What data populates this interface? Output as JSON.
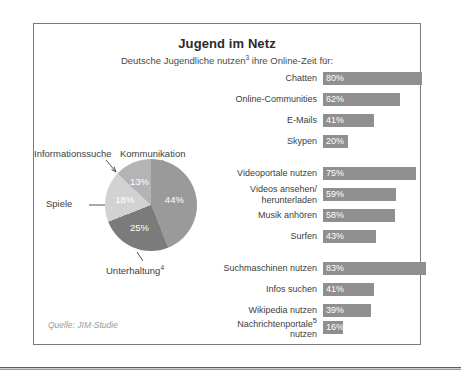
{
  "title": "Jugend im Netz",
  "subtitle_pre": "Deutsche Jugendliche nutzen",
  "subtitle_sup": "3",
  "subtitle_post": " ihre Online-Zeit für:",
  "source": "Quelle: JIM-Studie",
  "colors": {
    "bar": "#8f8f8f",
    "frame": "#7a7a7a",
    "pie_kommunikation": "#9a9a9a",
    "pie_unterhaltung": "#7b7b7b",
    "pie_spiele": "#d2d2d2",
    "pie_informationssuche": "#b4b4b4",
    "value_text": "#ffffff",
    "source_text": "#9a9a9a"
  },
  "chart_data": [
    {
      "type": "bar",
      "title": "Jugend im Netz",
      "subtitle": "Deutsche Jugendliche nutzen³ ihre Online-Zeit für:",
      "xlabel": "",
      "ylabel": "",
      "xlim": [
        0,
        100
      ],
      "unit": "%",
      "grid": false,
      "legend": "none",
      "orientation": "horizontal",
      "groups": [
        {
          "name": "Kommunikation",
          "categories": [
            "Chatten",
            "Online-Communities",
            "E-Mails",
            "Skypen"
          ],
          "values": [
            80,
            62,
            41,
            20
          ],
          "value_labels": [
            "80%",
            "62%",
            "41%",
            "20%"
          ]
        },
        {
          "name": "Unterhaltung",
          "categories": [
            "Videoportale nutzen",
            "Videos ansehen/\nherunterladen",
            "Musik anhören",
            "Surfen"
          ],
          "values": [
            75,
            59,
            58,
            43
          ],
          "value_labels": [
            "75%",
            "59%",
            "58%",
            "43%"
          ]
        },
        {
          "name": "Informationssuche",
          "categories": [
            "Suchmaschinen nutzen",
            "Infos suchen",
            "Wikipedia nutzen",
            "Nachrichtenportale⁵\nnutzen"
          ],
          "values": [
            83,
            41,
            39,
            16
          ],
          "value_labels": [
            "83%",
            "41%",
            "39%",
            "16%"
          ]
        }
      ]
    },
    {
      "type": "pie",
      "title": "",
      "legend": "callout-labels",
      "categories": [
        "Kommunikation",
        "Unterhaltung⁴",
        "Spiele",
        "Informationssuche"
      ],
      "values": [
        44,
        25,
        18,
        13
      ],
      "value_labels": [
        "44%",
        "25%",
        "18%",
        "13%"
      ],
      "colors": [
        "#9a9a9a",
        "#7b7b7b",
        "#d2d2d2",
        "#b4b4b4"
      ]
    }
  ],
  "bar_rows": [
    {
      "label": "Chatten",
      "value_label": "80%",
      "value": 80,
      "top": 0,
      "sup": ""
    },
    {
      "label": "Online-Communities",
      "value_label": "62%",
      "value": 62,
      "top": 21,
      "sup": ""
    },
    {
      "label": "E-Mails",
      "value_label": "41%",
      "value": 41,
      "top": 42,
      "sup": ""
    },
    {
      "label": "Skypen",
      "value_label": "20%",
      "value": 20,
      "top": 63,
      "sup": ""
    },
    {
      "label": "Videoportale nutzen",
      "value_label": "75%",
      "value": 75,
      "top": 95,
      "sup": ""
    },
    {
      "label": "Videos ansehen/\nherunterladen",
      "value_label": "59%",
      "value": 59,
      "top": 116,
      "sup": ""
    },
    {
      "label": "Musik anhören",
      "value_label": "58%",
      "value": 58,
      "top": 137,
      "sup": ""
    },
    {
      "label": "Surfen",
      "value_label": "43%",
      "value": 43,
      "top": 158,
      "sup": ""
    },
    {
      "label": "Suchmaschinen nutzen",
      "value_label": "83%",
      "value": 83,
      "top": 190,
      "sup": ""
    },
    {
      "label": "Infos suchen",
      "value_label": "41%",
      "value": 41,
      "top": 211,
      "sup": ""
    },
    {
      "label": "Wikipedia nutzen",
      "value_label": "39%",
      "value": 39,
      "top": 232,
      "sup": ""
    },
    {
      "label": "Nachrichtenportale",
      "value_label": "16%",
      "value": 16,
      "top": 249,
      "sup": "5",
      "label_after": "nutzen"
    }
  ],
  "pie": {
    "slices": [
      {
        "name": "Kommunikation",
        "value_label": "44%",
        "value": 44
      },
      {
        "name": "Unterhaltung",
        "value_label": "25%",
        "value": 25,
        "sup": "4"
      },
      {
        "name": "Spiele",
        "value_label": "18%",
        "value": 18
      },
      {
        "name": "Informationssuche",
        "value_label": "13%",
        "value": 13
      }
    ]
  }
}
